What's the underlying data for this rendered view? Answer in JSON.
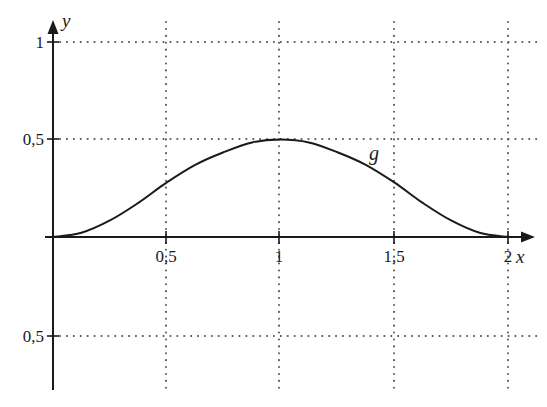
{
  "chart_data": {
    "type": "line",
    "title": "",
    "xlabel": "x",
    "ylabel": "y",
    "xlim": [
      0,
      2.1
    ],
    "ylim": [
      -0.75,
      1.1
    ],
    "grid": "dotted",
    "x_ticks": [
      0.5,
      1,
      1.5,
      2
    ],
    "x_tick_labels": [
      "0,5",
      "1",
      "1,5",
      "2"
    ],
    "y_ticks": [
      1,
      0.5,
      -0.5
    ],
    "y_tick_labels": [
      "1",
      "0,5",
      "0,5"
    ],
    "series": [
      {
        "name": "g",
        "x": [
          0,
          0.125,
          0.25,
          0.375,
          0.5,
          0.625,
          0.75,
          0.875,
          1,
          1.125,
          1.25,
          1.375,
          1.5,
          1.625,
          1.75,
          1.875,
          2
        ],
        "y": [
          0,
          0.022,
          0.085,
          0.175,
          0.28,
          0.37,
          0.435,
          0.485,
          0.5,
          0.485,
          0.435,
          0.37,
          0.28,
          0.175,
          0.085,
          0.022,
          0
        ]
      }
    ],
    "annotations": [
      {
        "text": "g",
        "x": 1.42,
        "y": 0.4
      }
    ]
  },
  "labels": {
    "x_axis": "x",
    "y_axis": "y",
    "curve": "g",
    "xt_05": "0,5",
    "xt_1": "1",
    "xt_15": "1,5",
    "xt_2": "2",
    "yt_1": "1",
    "yt_05": "0,5",
    "yt_m05": "0,5"
  },
  "colors": {
    "ink": "#1a1a1a",
    "grid": "#555555",
    "background": "#ffffff"
  }
}
